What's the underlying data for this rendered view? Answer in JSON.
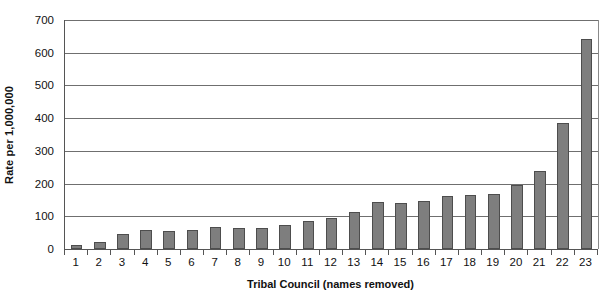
{
  "chart_data": {
    "type": "bar",
    "title": "",
    "xlabel": "Tribal Council (names removed)",
    "ylabel": "Rate per 1,000,000",
    "categories": [
      "1",
      "2",
      "3",
      "4",
      "5",
      "6",
      "7",
      "8",
      "9",
      "10",
      "11",
      "12",
      "13",
      "14",
      "15",
      "16",
      "17",
      "18",
      "19",
      "20",
      "21",
      "22",
      "23"
    ],
    "values": [
      12,
      21,
      45,
      57,
      56,
      58,
      66,
      64,
      65,
      72,
      86,
      95,
      113,
      145,
      141,
      148,
      163,
      165,
      167,
      197,
      237,
      385,
      643
    ],
    "ylim": [
      0,
      700
    ],
    "ytick_labels": [
      "0",
      "100",
      "200",
      "300",
      "400",
      "500",
      "600",
      "700"
    ],
    "ytick_values": [
      0,
      100,
      200,
      300,
      400,
      500,
      600,
      700
    ],
    "grid": true,
    "legend": "none",
    "bar_color": "#7e7e7e",
    "bar_border_color": "#4d4d4d",
    "axis_color": "#555555",
    "gridline_color": "#6f6f6f",
    "background": "#ffffff"
  }
}
